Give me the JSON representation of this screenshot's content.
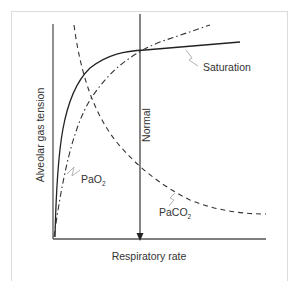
{
  "figure": {
    "x_axis_label": "Respiratory rate",
    "y_axis_label": "Alveolar gas tension",
    "normal_marker_label": "Normal",
    "curves": [
      {
        "name": "Saturation",
        "label": "Saturation",
        "style": "solid"
      },
      {
        "name": "PaO2",
        "label_main": "PaO",
        "label_sub": "2",
        "style": "dash-dot"
      },
      {
        "name": "PaCO2",
        "label_main": "PaCO",
        "label_sub": "2",
        "style": "dashed"
      }
    ],
    "colors": {
      "line": "#222222",
      "leader": "#aaaaaa",
      "frame": "#dcdcdc"
    }
  }
}
